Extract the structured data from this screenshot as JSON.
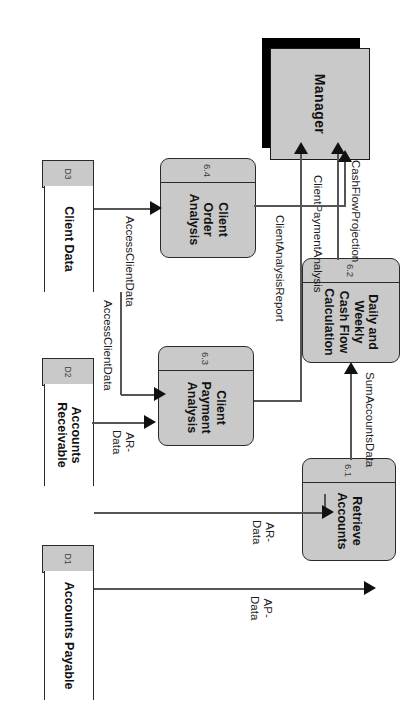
{
  "diagram": {
    "type": "data-flow-diagram",
    "orientation": "rotated-90-clockwise",
    "colors": {
      "process_fill": "#c9c9c9",
      "entity_fill": "#c9c9c9",
      "entity_shadow": "#000000",
      "store_fill": "#ffffff",
      "store_dcell_fill": "#c9c9c9",
      "line": "#555555",
      "text": "#111111",
      "background": "#ffffff"
    }
  },
  "entities": [
    {
      "id": "manager",
      "name": "Manager"
    }
  ],
  "processes": [
    {
      "id": "p61",
      "number": "6.1",
      "name": "Retrieve\nAccounts"
    },
    {
      "id": "p62",
      "number": "6.2",
      "name": "Daily and\nWeekly\nCash Flow\nCalculation"
    },
    {
      "id": "p63",
      "number": "6.3",
      "name": "Client\nPayment\nAnalysis"
    },
    {
      "id": "p64",
      "number": "6.4",
      "name": "Client Order\nAnalysis"
    }
  ],
  "data_stores": [
    {
      "id": "d1",
      "number": "D1",
      "name": "Accounts Payable"
    },
    {
      "id": "d2",
      "number": "D2",
      "name": "Accounts\nReceivable"
    },
    {
      "id": "d3",
      "number": "D3",
      "name": "Client Data"
    }
  ],
  "flows": [
    {
      "id": "f1",
      "label": "CashFlowProjection",
      "from": "p62",
      "to": "manager"
    },
    {
      "id": "f2",
      "label": "ClientPaymentAnalysis",
      "from": "p63",
      "to": "manager"
    },
    {
      "id": "f3",
      "label": "ClientAnalysisReport",
      "from": "p64",
      "to": "manager"
    },
    {
      "id": "f4",
      "label": "AccessClientData",
      "from": "d3",
      "to": "p64"
    },
    {
      "id": "f5",
      "label": "AccessClientData",
      "from": "d3",
      "to": "p63"
    },
    {
      "id": "f6",
      "label": "AR-\nData",
      "from": "d2",
      "to": "p63"
    },
    {
      "id": "f7",
      "label": "AR-\nData",
      "from": "d2",
      "to": "p61"
    },
    {
      "id": "f8",
      "label": "AP-\nData",
      "from": "d1",
      "to": "p61"
    },
    {
      "id": "f9",
      "label": "SumAccountsData",
      "from": "p61",
      "to": "p62"
    }
  ]
}
